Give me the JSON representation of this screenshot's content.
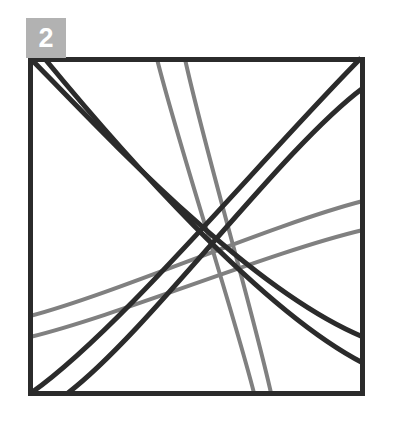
{
  "figure": {
    "badge": {
      "label": "2",
      "background_color": "#b2b2b2",
      "text_color": "#ffffff"
    },
    "frame": {
      "color": "#2b2b2b",
      "stroke_width": 5,
      "left": 28,
      "top": 57,
      "right": 363,
      "bottom": 395
    },
    "colors": {
      "dark_line": "#2b2b2b",
      "gray_line": "#808080",
      "background": "#ffffff"
    },
    "dark_stroke_width": 5,
    "gray_stroke_width": 4,
    "dark_curves": [
      {
        "name": "dark-curve-tl-br-outer",
        "path": "M 31 59 C 110 140 250 290 363 337"
      },
      {
        "name": "dark-curve-tl-br-inner",
        "path": "M 45 59 C 120 150 260 310 363 363"
      },
      {
        "name": "dark-curve-bl-tr-outer",
        "path": "M 31 393 C 120 330 260 160 361 58"
      },
      {
        "name": "dark-curve-bl-tr-inner",
        "path": "M 68 393 C 150 330 280 150 363 88"
      }
    ],
    "gray_lines": [
      {
        "name": "gray-line-top-left-entry",
        "path": "M 157 59 C 180 150 230 300 254 393"
      },
      {
        "name": "gray-line-top-right-entry",
        "path": "M 185 59 C 205 150 250 300 271 393"
      },
      {
        "name": "gray-line-left-upper",
        "path": "M 30 316 C 120 292 270 225 363 201"
      },
      {
        "name": "gray-line-left-lower",
        "path": "M 30 337 C 120 315 270 252 363 230"
      }
    ],
    "convergence_point": {
      "x": 220,
      "y": 255
    }
  }
}
